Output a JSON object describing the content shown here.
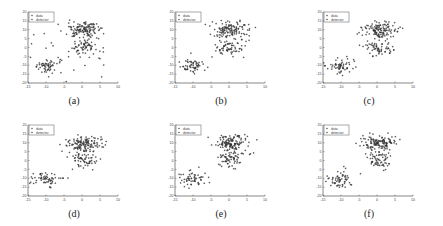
{
  "figure": {
    "panels": [
      {
        "id": "a",
        "caption": "(a)",
        "left": 0,
        "top": 0
      },
      {
        "id": "b",
        "caption": "(b)",
        "left": 147,
        "top": 0
      },
      {
        "id": "c",
        "caption": "(c)",
        "left": 295,
        "top": 0
      },
      {
        "id": "d",
        "caption": "(d)",
        "left": 0,
        "top": 113
      },
      {
        "id": "e",
        "caption": "(e)",
        "left": 147,
        "top": 113
      },
      {
        "id": "f",
        "caption": "(f)",
        "left": 295,
        "top": 113
      }
    ],
    "legend": [
      "data",
      "detector"
    ]
  },
  "chart_data": [
    {
      "type": "scatter",
      "panel": "(a)",
      "legend": [
        "data",
        "detector"
      ],
      "xlim": [
        -15,
        10
      ],
      "ylim": [
        -20,
        20
      ],
      "xticks": [
        -15,
        -10,
        -5,
        0,
        5,
        10
      ],
      "yticks": [
        -20,
        -15,
        -10,
        -5,
        0,
        5,
        10,
        15,
        20
      ],
      "grid": false,
      "legend_position": "upper left",
      "detector_spread": "wide",
      "clusters": [
        {
          "center": [
            0,
            10
          ],
          "spread": 2.5
        },
        {
          "center": [
            0,
            -1
          ],
          "spread": 2
        },
        {
          "center": [
            -10,
            -10
          ],
          "spread": 2
        }
      ]
    },
    {
      "type": "scatter",
      "panel": "(b)",
      "legend": [
        "data",
        "detector"
      ],
      "xlim": [
        -15,
        10
      ],
      "ylim": [
        -20,
        20
      ],
      "xticks": [
        -15,
        -10,
        -5,
        0,
        5,
        10
      ],
      "yticks": [
        -20,
        -15,
        -10,
        -5,
        0,
        5,
        10,
        15,
        20
      ],
      "grid": false,
      "legend_position": "upper left",
      "detector_spread": "medium"
    },
    {
      "type": "scatter",
      "panel": "(c)",
      "legend": [
        "data",
        "detector"
      ],
      "xlim": [
        -15,
        10
      ],
      "ylim": [
        -20,
        20
      ],
      "xticks": [
        -15,
        -10,
        -5,
        0,
        5,
        10
      ],
      "yticks": [
        -20,
        -15,
        -10,
        -5,
        0,
        5,
        10,
        15,
        20
      ],
      "grid": false,
      "legend_position": "upper left",
      "detector_spread": "narrow"
    },
    {
      "type": "scatter",
      "panel": "(d)",
      "legend": [
        "data",
        "detector"
      ],
      "xlim": [
        -15,
        10
      ],
      "ylim": [
        -20,
        20
      ],
      "xticks": [
        -15,
        -10,
        -5,
        0,
        5,
        10
      ],
      "yticks": [
        -20,
        -15,
        -10,
        -5,
        0,
        5,
        10,
        15,
        20
      ],
      "grid": false,
      "legend_position": "upper left",
      "detector_spread": "narrow"
    },
    {
      "type": "scatter",
      "panel": "(e)",
      "legend": [
        "data",
        "detector"
      ],
      "xlim": [
        -15,
        10
      ],
      "ylim": [
        -20,
        20
      ],
      "xticks": [
        -15,
        -10,
        -5,
        0,
        5,
        10
      ],
      "yticks": [
        -20,
        -15,
        -10,
        -5,
        0,
        5,
        10,
        15,
        20
      ],
      "grid": false,
      "legend_position": "upper left",
      "detector_spread": "narrow"
    },
    {
      "type": "scatter",
      "panel": "(f)",
      "legend": [
        "data",
        "detector"
      ],
      "xlim": [
        -15,
        10
      ],
      "ylim": [
        -20,
        20
      ],
      "xticks": [
        -15,
        -10,
        -5,
        0,
        5,
        10
      ],
      "yticks": [
        -20,
        -15,
        -10,
        -5,
        0,
        5,
        10,
        15,
        20
      ],
      "grid": false,
      "legend_position": "upper left",
      "detector_spread": "narrow"
    }
  ]
}
